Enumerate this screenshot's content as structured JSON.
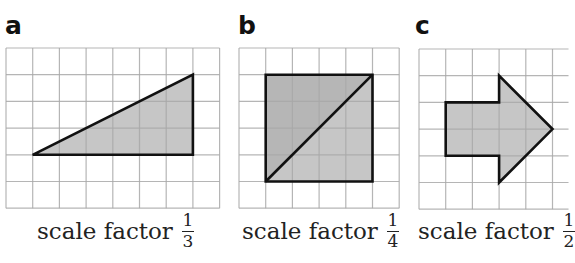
{
  "figure": {
    "cell_px": 26.7,
    "colors": {
      "grid": "#a8a8a8",
      "outline": "#111111",
      "fill": "#c6c6c6",
      "fill_dark": "#b6b6b6",
      "text": "#222222"
    },
    "panels": [
      {
        "id": "a",
        "heading": "a",
        "caption": "scale factor",
        "fraction": {
          "numerator": "1",
          "denominator": "3"
        },
        "grid": {
          "x": 6,
          "y": 48,
          "cols": 8,
          "rows": 6
        },
        "shape": "right-triangle",
        "polygons": [
          {
            "points_cells": [
              [
                1,
                4
              ],
              [
                7,
                4
              ],
              [
                7,
                1
              ]
            ],
            "fill": "fill"
          }
        ]
      },
      {
        "id": "b",
        "heading": "b",
        "caption": "scale factor",
        "fraction": {
          "numerator": "1",
          "denominator": "4"
        },
        "grid": {
          "x": 239,
          "y": 48,
          "cols": 6,
          "rows": 6
        },
        "shape": "square-with-diagonal",
        "polygons": [
          {
            "points_cells": [
              [
                1,
                1
              ],
              [
                5,
                1
              ],
              [
                1,
                5
              ]
            ],
            "fill": "fill_dark"
          },
          {
            "points_cells": [
              [
                5,
                1
              ],
              [
                5,
                5
              ],
              [
                1,
                5
              ]
            ],
            "fill": "fill"
          }
        ],
        "outline": [
          [
            1,
            1
          ],
          [
            5,
            1
          ],
          [
            5,
            5
          ],
          [
            1,
            5
          ]
        ],
        "diagonal": [
          [
            1,
            5
          ],
          [
            5,
            1
          ]
        ]
      },
      {
        "id": "c",
        "heading": "c",
        "caption": "scale factor",
        "fraction": {
          "numerator": "1",
          "denominator": "2"
        },
        "grid": {
          "x": 419,
          "y": 49,
          "cols": 5.6,
          "rows": 6
        },
        "shape": "arrow-right",
        "polygons": [
          {
            "points_cells": [
              [
                1,
                2
              ],
              [
                3,
                2
              ],
              [
                3,
                1
              ],
              [
                5,
                3
              ],
              [
                3,
                5
              ],
              [
                3,
                4
              ],
              [
                1,
                4
              ]
            ],
            "fill": "fill"
          }
        ]
      }
    ]
  }
}
